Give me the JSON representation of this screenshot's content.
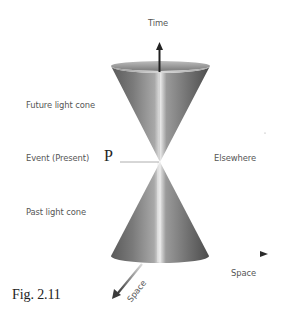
{
  "figure": {
    "caption": "Fig. 2.11",
    "event_marker": "P",
    "labels": {
      "time_axis": "Time",
      "future_cone": "Future light cone",
      "event": "Event (Present)",
      "elsewhere": "Elsewhere",
      "past_cone": "Past light cone",
      "space_axis_x": "Space",
      "space_axis_y": "Space"
    },
    "colors": {
      "background": "#ffffff",
      "cone_dark": "#4a4a4a",
      "cone_mid": "#8c8c8c",
      "cone_light": "#e6e6e6",
      "arrow": "#2a2a2a",
      "label_text": "#555555",
      "caption_text": "#222222"
    }
  }
}
